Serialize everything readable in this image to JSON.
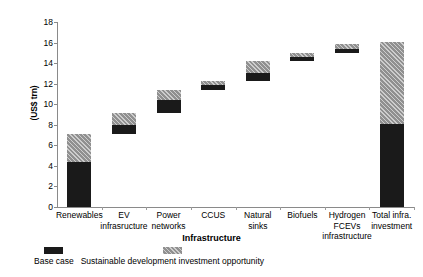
{
  "chart_data": {
    "type": "bar",
    "subtype": "waterfall-stacked",
    "title": "",
    "xlabel": "Infrastructure",
    "ylabel": "(US$ trn)",
    "ylim": [
      0,
      18
    ],
    "ytick_values": [
      0,
      2,
      4,
      6,
      8,
      10,
      12,
      14,
      16,
      18
    ],
    "ytick_labels": [
      "0",
      "2",
      "4",
      "6",
      "8",
      "10",
      "12",
      "14",
      "16",
      "18"
    ],
    "grid": false,
    "legend_position": "below-left",
    "categories": [
      "Renewables",
      "EV\ninfrasructure",
      "Power\nnetworks",
      "CCUS",
      "Natural\nsinks",
      "Biofuels",
      "Hydrogen\nFCEVs\ninfrastructure",
      "Total infra.\ninvestment"
    ],
    "series": [
      {
        "name": "Base case",
        "color": "#1a1a1a",
        "values": [
          4.4,
          0.9,
          1.3,
          0.5,
          0.7,
          0.4,
          0.4,
          8.1
        ]
      },
      {
        "name": "Sustainable development investment opportunity",
        "color": "#909090",
        "values": [
          2.7,
          1.1,
          1.0,
          0.4,
          1.2,
          0.4,
          0.5,
          8.0
        ]
      }
    ],
    "bars": [
      {
        "category": "Renewables",
        "base_start": 0.0,
        "base_end": 4.4,
        "sdio_start": 4.4,
        "sdio_end": 7.1
      },
      {
        "category": "EV infrasructure",
        "base_start": 7.1,
        "base_end": 8.0,
        "sdio_start": 8.0,
        "sdio_end": 9.1
      },
      {
        "category": "Power networks",
        "base_start": 9.1,
        "base_end": 10.4,
        "sdio_start": 10.4,
        "sdio_end": 11.4
      },
      {
        "category": "CCUS",
        "base_start": 11.4,
        "base_end": 11.9,
        "sdio_start": 11.9,
        "sdio_end": 12.3
      },
      {
        "category": "Natural sinks",
        "base_start": 12.3,
        "base_end": 13.0,
        "sdio_start": 13.0,
        "sdio_end": 14.2
      },
      {
        "category": "Biofuels",
        "base_start": 14.2,
        "base_end": 14.6,
        "sdio_start": 14.6,
        "sdio_end": 15.0
      },
      {
        "category": "Hydrogen FCEVs infrastructure",
        "base_start": 15.0,
        "base_end": 15.4,
        "sdio_start": 15.4,
        "sdio_end": 15.9
      },
      {
        "category": "Total infra. investment",
        "base_start": 0.0,
        "base_end": 8.1,
        "sdio_start": 8.1,
        "sdio_end": 16.1
      }
    ],
    "legend": [
      {
        "label": "Base case",
        "color": "#1a1a1a",
        "pattern": "solid"
      },
      {
        "label": "Sustainable development investment opportunity",
        "color": "#909090",
        "pattern": "diagonal-hatch"
      }
    ]
  }
}
